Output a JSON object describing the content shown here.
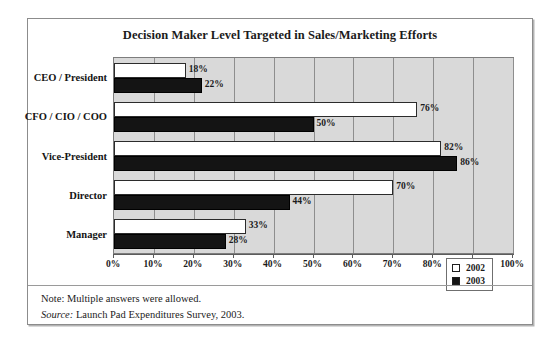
{
  "figure": {
    "title": "Decision Maker Level Targeted in Sales/Marketing Efforts",
    "note": "Note: Multiple answers were allowed.",
    "source_label": "Source:",
    "source_text": " Launch Pad Expenditures Survey, 2003."
  },
  "legend": {
    "entries": [
      {
        "label": "2002",
        "swatch": "white-square-icon"
      },
      {
        "label": "2003",
        "swatch": "black-square-icon"
      }
    ]
  },
  "axis": {
    "x_ticks": [
      "0%",
      "10%",
      "20%",
      "30%",
      "40%",
      "50%",
      "60%",
      "70%",
      "80%",
      "90%",
      "100%"
    ]
  },
  "chart_data": {
    "type": "bar",
    "orientation": "horizontal",
    "title": "Decision Maker Level Targeted in Sales/Marketing Efforts",
    "xlabel": "",
    "ylabel": "",
    "xlim": [
      0,
      100
    ],
    "x_unit": "%",
    "grid": true,
    "legend_position": "inside-right",
    "categories": [
      "CEO / President",
      "CFO / CIO / COO",
      "Vice-President",
      "Director",
      "Manager"
    ],
    "series": [
      {
        "name": "2002",
        "color": "#ffffff",
        "values": [
          18,
          76,
          82,
          70,
          33
        ],
        "labels": [
          "18%",
          "76%",
          "82%",
          "70%",
          "33%"
        ]
      },
      {
        "name": "2003",
        "color": "#141414",
        "values": [
          22,
          50,
          86,
          44,
          28
        ],
        "labels": [
          "22%",
          "50%",
          "86%",
          "44%",
          "28%"
        ]
      }
    ],
    "annotations": [
      "Note: Multiple answers were allowed.",
      "Source: Launch Pad Expenditures Survey, 2003."
    ]
  },
  "colors": {
    "plot_background": "#d9d9d9",
    "gridline": "#8e8e8e",
    "frame": "#8c8c8c",
    "series_2002": "#ffffff",
    "series_2003": "#141414"
  }
}
